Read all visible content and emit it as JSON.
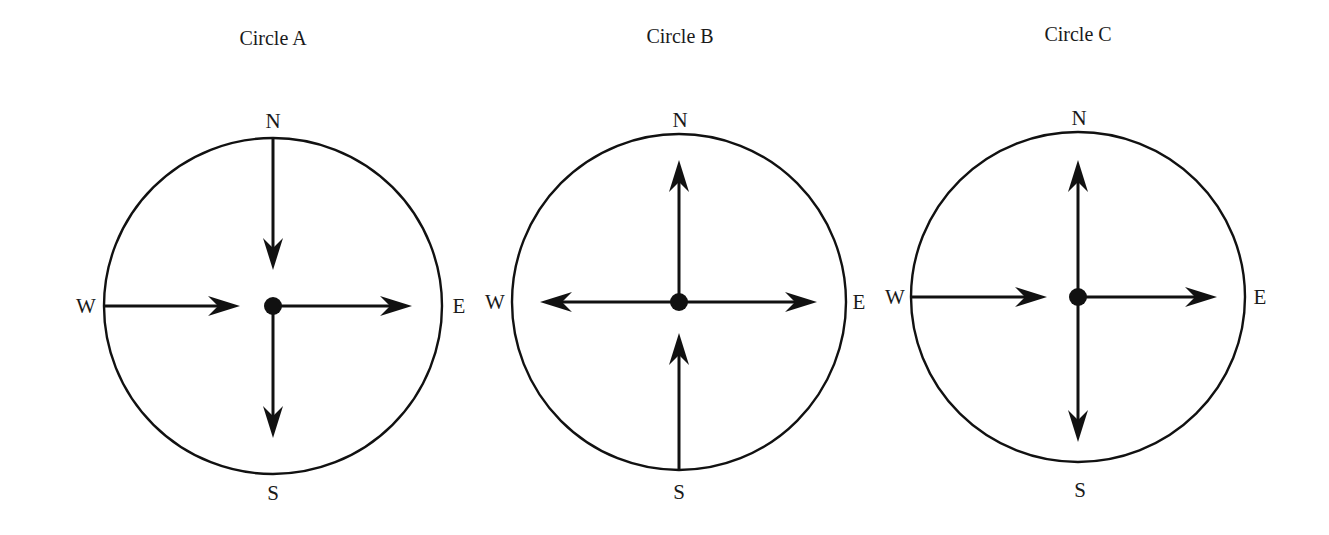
{
  "diagram": {
    "colors": {
      "stroke": "#111111",
      "text": "#1a1a1a",
      "background": "#ffffff"
    },
    "circles": [
      {
        "id": "A",
        "title": "Circle A",
        "center": [
          273,
          306
        ],
        "radius": [
          169,
          168
        ],
        "labels": {
          "N": "N",
          "S": "S",
          "E": "E",
          "W": "W"
        },
        "arrows": [
          {
            "name": "north-inward-arrow",
            "from": [
              273,
              138
            ],
            "to": [
              273,
              268
            ],
            "points": "toward-center"
          },
          {
            "name": "west-inward-arrow",
            "from": [
              104,
              306
            ],
            "to": [
              238,
              306
            ],
            "points": "toward-center"
          },
          {
            "name": "east-outward-arrow",
            "from": [
              273,
              306
            ],
            "to": [
              410,
              306
            ],
            "points": "away-from-center"
          },
          {
            "name": "south-outward-arrow",
            "from": [
              273,
              306
            ],
            "to": [
              273,
              436
            ],
            "points": "away-from-center"
          }
        ]
      },
      {
        "id": "B",
        "title": "Circle B",
        "center": [
          679,
          302
        ],
        "radius": [
          167,
          168
        ],
        "labels": {
          "N": "N",
          "S": "S",
          "E": "E",
          "W": "W"
        },
        "arrows": [
          {
            "name": "north-outward-arrow",
            "from": [
              679,
              302
            ],
            "to": [
              679,
              162
            ],
            "points": "away-from-center"
          },
          {
            "name": "west-outward-arrow",
            "from": [
              679,
              302
            ],
            "to": [
              542,
              302
            ],
            "points": "away-from-center"
          },
          {
            "name": "east-outward-arrow",
            "from": [
              679,
              302
            ],
            "to": [
              815,
              302
            ],
            "points": "away-from-center"
          },
          {
            "name": "south-inward-arrow",
            "from": [
              679,
              471
            ],
            "to": [
              679,
              334
            ],
            "points": "toward-center"
          }
        ]
      },
      {
        "id": "C",
        "title": "Circle C",
        "center": [
          1078,
          297
        ],
        "radius": [
          167,
          165
        ],
        "labels": {
          "N": "N",
          "S": "S",
          "E": "E",
          "W": "W"
        },
        "arrows": [
          {
            "name": "north-outward-arrow",
            "from": [
              1078,
              297
            ],
            "to": [
              1078,
              162
            ],
            "points": "away-from-center"
          },
          {
            "name": "west-inward-arrow",
            "from": [
              910,
              297
            ],
            "to": [
              1045,
              297
            ],
            "points": "toward-center"
          },
          {
            "name": "east-outward-arrow",
            "from": [
              1078,
              297
            ],
            "to": [
              1215,
              297
            ],
            "points": "away-from-center"
          },
          {
            "name": "south-outward-arrow",
            "from": [
              1078,
              297
            ],
            "to": [
              1078,
              440
            ],
            "points": "away-from-center"
          }
        ]
      }
    ]
  }
}
